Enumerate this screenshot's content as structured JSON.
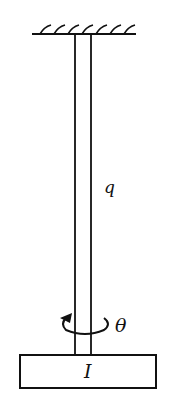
{
  "diagram": {
    "labels": {
      "rod_label": "q",
      "angle_label": "θ",
      "disk_label": "I"
    },
    "colors": {
      "stroke": "#111111",
      "background": "#ffffff"
    }
  }
}
